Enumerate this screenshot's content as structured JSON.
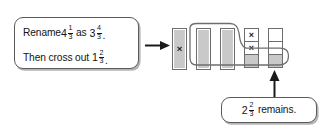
{
  "figure": {
    "instruction": {
      "line1": {
        "lead": "Rename",
        "value_a": {
          "whole": "4",
          "num": "1",
          "den": "3"
        },
        "middle": "as",
        "value_b": {
          "whole": "3",
          "num": "4",
          "den": "3"
        },
        "end": "."
      },
      "line2": {
        "lead": "Then cross out",
        "value": {
          "whole": "1",
          "num": "2",
          "den": "3"
        },
        "end": "."
      }
    },
    "remains_callout": {
      "value": {
        "whole": "2",
        "num": "2",
        "den": "3"
      },
      "label": "remains."
    },
    "bar_model": {
      "total_bars": 5,
      "bars": [
        {
          "id": "bar1",
          "type": "whole",
          "state": "crossed-out",
          "mark": "×"
        },
        {
          "id": "bar2",
          "type": "whole",
          "state": "remaining",
          "mark": ""
        },
        {
          "id": "bar3",
          "type": "whole",
          "state": "remaining",
          "mark": ""
        },
        {
          "id": "bar4",
          "type": "thirds",
          "parts": [
            {
              "state": "crossed-out",
              "mark": "×",
              "fill": "white"
            },
            {
              "state": "crossed-out",
              "mark": "×",
              "fill": "white"
            },
            {
              "state": "remaining",
              "mark": "",
              "fill": "gray"
            }
          ]
        },
        {
          "id": "bar5",
          "type": "thirds",
          "parts": [
            {
              "state": "empty",
              "mark": "",
              "fill": "white"
            },
            {
              "state": "empty",
              "mark": "",
              "fill": "white"
            },
            {
              "state": "remaining",
              "mark": "",
              "fill": "gray"
            }
          ]
        }
      ]
    },
    "icons": {
      "flow_arrow": "arrow-right-icon",
      "pointer_arrow": "arrow-up-icon",
      "cross_out": "times-icon",
      "lasso": "lasso-outline-icon"
    },
    "colors": {
      "bar_fill": "#c9c9c9",
      "bar_stroke": "#6d6d6d",
      "box_stroke": "#5b5b5b",
      "text": "#131313",
      "arrow": "#1a1a1a",
      "background": "#ffffff"
    }
  }
}
